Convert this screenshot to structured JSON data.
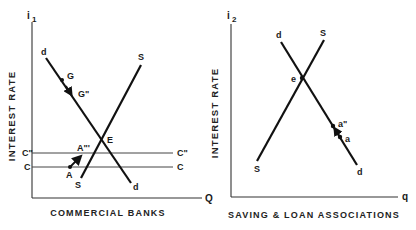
{
  "panels": [
    {
      "id": "commercial-banks",
      "title": "COMMERCIAL BANKS",
      "y_axis_symbol": "i",
      "y_axis_subscript": "1",
      "y_axis_label": "INTEREST RATE",
      "x_axis_label": "Q",
      "demand_label": "d",
      "supply_label": "S",
      "equilibrium_label": "E",
      "points": {
        "G": "G",
        "G2": "G\"",
        "A": "A",
        "A3": "A\"'"
      },
      "horizontal_lines": [
        {
          "left_label": "C\"",
          "right_label": "C\""
        },
        {
          "left_label": "C",
          "right_label": "C"
        }
      ]
    },
    {
      "id": "saving-loan",
      "title": "SAVING & LOAN ASSOCIATIONS",
      "y_axis_symbol": "i",
      "y_axis_subscript": "2",
      "y_axis_label": "INTEREST RATE",
      "x_axis_label": "q",
      "demand_label": "d",
      "supply_label": "S",
      "equilibrium_label": "e",
      "points": {
        "a": "a",
        "a2": "a\""
      }
    }
  ],
  "colors": {
    "ink": "#111111",
    "background": "#ffffff"
  }
}
